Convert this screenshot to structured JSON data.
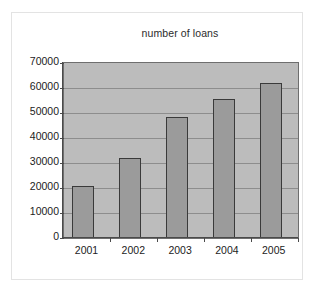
{
  "chart_data": {
    "type": "bar",
    "title": "number of loans",
    "xlabel": "",
    "ylabel": "",
    "categories": [
      "2001",
      "2002",
      "2003",
      "2004",
      "2005"
    ],
    "values": [
      21000,
      32000,
      48500,
      55500,
      62000
    ],
    "series": [
      {
        "name": "number of loans",
        "values": [
          21000,
          32000,
          48500,
          55500,
          62000
        ]
      }
    ],
    "ylim": [
      0,
      70000
    ],
    "ytick_labels": [
      "0",
      "10000",
      "20000",
      "30000",
      "40000",
      "50000",
      "60000",
      "70000"
    ],
    "ytick_values": [
      0,
      10000,
      20000,
      30000,
      40000,
      50000,
      60000,
      70000
    ],
    "grid": true,
    "legend": false,
    "legend_position": "none",
    "colors": {
      "bar_fill": "#9b9b9b",
      "bar_border": "#3a3a3a",
      "plot_background": "#bcbcbc",
      "gridline": "#8d8d8d",
      "axis": "#4a4a4a",
      "text": "#1c1c1c",
      "page_background": "#ffffff"
    }
  }
}
